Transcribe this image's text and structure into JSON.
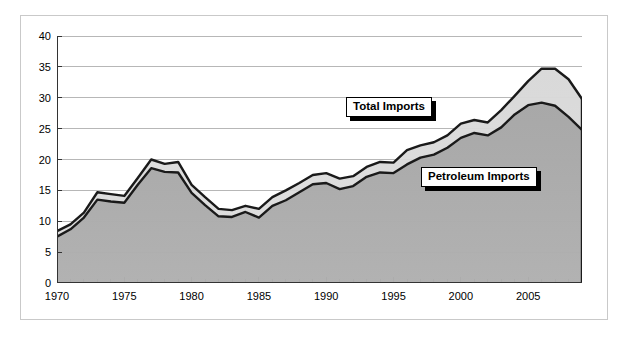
{
  "chart_data": {
    "type": "area",
    "title": "",
    "subtitle": "",
    "xlabel": "",
    "ylabel": "",
    "xlim": [
      1970,
      2009
    ],
    "ylim": [
      0,
      40
    ],
    "ytick_values": [
      0,
      5,
      10,
      15,
      20,
      25,
      30,
      35,
      40
    ],
    "xtick_values": [
      1970,
      1975,
      1980,
      1985,
      1990,
      1995,
      2000,
      2005
    ],
    "xtick_labels": [
      "1970",
      "1975",
      "1980",
      "1985",
      "1990",
      "1995",
      "2000",
      "2005"
    ],
    "ytick_labels": [
      "0",
      "5",
      "10",
      "15",
      "20",
      "25",
      "30",
      "35",
      "40"
    ],
    "minor_xticks_every": 1,
    "grid": "horizontal",
    "legend_position": "inline-annotations",
    "stacking": "overlaid",
    "x": [
      1970,
      1971,
      1972,
      1973,
      1974,
      1975,
      1976,
      1977,
      1978,
      1979,
      1980,
      1981,
      1982,
      1983,
      1984,
      1985,
      1986,
      1987,
      1988,
      1989,
      1990,
      1991,
      1992,
      1993,
      1994,
      1995,
      1996,
      1997,
      1998,
      1999,
      2000,
      2001,
      2002,
      2003,
      2004,
      2005,
      2006,
      2007,
      2008,
      2009
    ],
    "series": [
      {
        "name": "Total Imports",
        "fill_color": "#d9d9d9",
        "line_color": "#1a1a1a",
        "values": [
          8.4,
          9.5,
          11.4,
          14.7,
          14.4,
          14.1,
          17.0,
          20.0,
          19.3,
          19.6,
          15.9,
          13.9,
          12.0,
          11.8,
          12.5,
          12.0,
          13.9,
          15.0,
          16.2,
          17.5,
          17.8,
          16.9,
          17.3,
          18.8,
          19.6,
          19.5,
          21.5,
          22.3,
          22.8,
          23.9,
          25.8,
          26.4,
          26.0,
          28.0,
          30.3,
          32.7,
          34.7,
          34.7,
          33.0,
          29.8
        ]
      },
      {
        "name": "Petroleum Imports",
        "fill_color": "#a8a8a8",
        "line_color": "#1a1a1a",
        "values": [
          7.5,
          8.7,
          10.6,
          13.5,
          13.2,
          13.0,
          15.9,
          18.6,
          18.0,
          17.9,
          14.6,
          12.6,
          10.8,
          10.7,
          11.5,
          10.6,
          12.5,
          13.4,
          14.7,
          16.0,
          16.2,
          15.2,
          15.7,
          17.2,
          17.9,
          17.8,
          19.2,
          20.3,
          20.8,
          21.9,
          23.5,
          24.3,
          23.9,
          25.2,
          27.3,
          28.8,
          29.2,
          28.7,
          26.9,
          24.8
        ]
      }
    ],
    "annotations": [
      {
        "text": "Total Imports",
        "target_series": "Total Imports"
      },
      {
        "text": "Petroleum Imports",
        "target_series": "Petroleum Imports"
      }
    ]
  },
  "axes": {
    "y_axis_name": "value-axis",
    "x_axis_name": "year-axis"
  }
}
